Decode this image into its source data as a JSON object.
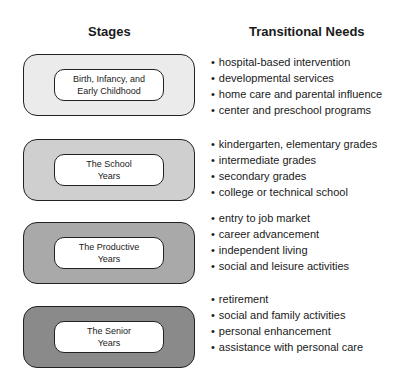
{
  "headers": {
    "stages": "Stages",
    "needs": "Transitional Needs"
  },
  "stages": [
    {
      "line1": "Birth, Infancy, and",
      "line2": "Early Childhood",
      "fill": "#ebebeb",
      "needs": [
        "hospital-based intervention",
        "developmental services",
        "home care and parental influence",
        "center and preschool programs"
      ]
    },
    {
      "line1": "The School",
      "line2": "Years",
      "fill": "#cfcfcf",
      "needs": [
        "kindergarten, elementary grades",
        "intermediate grades",
        "secondary grades",
        "college or technical school"
      ]
    },
    {
      "line1": "The Productive",
      "line2": "Years",
      "fill": "#a9a9a9",
      "needs": [
        "entry to job market",
        "career advancement",
        "independent living",
        "social and leisure activities"
      ]
    },
    {
      "line1": "The Senior",
      "line2": "Years",
      "fill": "#8a8a8a",
      "needs": [
        "retirement",
        "social and family activities",
        "personal enhancement",
        "assistance with personal care"
      ]
    }
  ]
}
